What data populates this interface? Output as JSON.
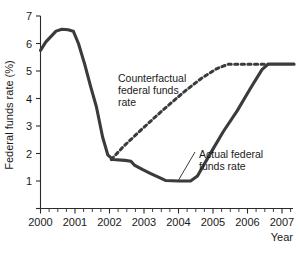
{
  "chart_data": {
    "type": "line",
    "title": "",
    "xlabel": "Year",
    "ylabel": "Federal funds rate (%)",
    "xlim": [
      2000,
      2007.35
    ],
    "ylim": [
      0,
      7
    ],
    "grid": false,
    "legend_position": "inline-annotations",
    "xticks": [
      "2000",
      "2001",
      "2002",
      "2003",
      "2004",
      "2005",
      "2006",
      "2007"
    ],
    "xtick_values": [
      2000,
      2001,
      2002,
      2003,
      2004,
      2005,
      2006,
      2007
    ],
    "xminor_per_interval": 3,
    "yticks": [
      "1",
      "2",
      "3",
      "4",
      "5",
      "6",
      "7"
    ],
    "ytick_values": [
      1,
      2,
      3,
      4,
      5,
      6,
      7
    ],
    "series": [
      {
        "name": "Actual federal funds rate",
        "style": "solid",
        "color": "#3b3b3b",
        "points": [
          [
            2000.0,
            5.75
          ],
          [
            2000.15,
            6.05
          ],
          [
            2000.3,
            6.25
          ],
          [
            2000.45,
            6.45
          ],
          [
            2000.62,
            6.52
          ],
          [
            2000.8,
            6.5
          ],
          [
            2000.95,
            6.45
          ],
          [
            2001.1,
            6.0
          ],
          [
            2001.28,
            5.25
          ],
          [
            2001.45,
            4.45
          ],
          [
            2001.62,
            3.7
          ],
          [
            2001.8,
            2.6
          ],
          [
            2001.95,
            1.95
          ],
          [
            2002.1,
            1.78
          ],
          [
            2002.45,
            1.75
          ],
          [
            2002.62,
            1.72
          ],
          [
            2002.72,
            1.58
          ],
          [
            2002.95,
            1.42
          ],
          [
            2003.18,
            1.28
          ],
          [
            2003.45,
            1.12
          ],
          [
            2003.62,
            1.02
          ],
          [
            2004.0,
            1.0
          ],
          [
            2004.35,
            1.0
          ],
          [
            2004.55,
            1.18
          ],
          [
            2004.9,
            1.95
          ],
          [
            2005.3,
            2.8
          ],
          [
            2005.7,
            3.55
          ],
          [
            2006.1,
            4.4
          ],
          [
            2006.42,
            5.05
          ],
          [
            2006.6,
            5.25
          ],
          [
            2007.35,
            5.25
          ]
        ]
      },
      {
        "name": "Counterfactual federal funds rate",
        "style": "dashed",
        "color": "#3b3b3b",
        "points": [
          [
            2002.05,
            1.78
          ],
          [
            2002.4,
            2.25
          ],
          [
            2002.85,
            2.78
          ],
          [
            2003.3,
            3.3
          ],
          [
            2003.75,
            3.8
          ],
          [
            2004.2,
            4.28
          ],
          [
            2004.65,
            4.72
          ],
          [
            2005.1,
            5.08
          ],
          [
            2005.45,
            5.25
          ],
          [
            2006.6,
            5.25
          ]
        ]
      }
    ],
    "annotations": [
      {
        "name": "counterfactual-label",
        "lines": [
          "Counterfactual",
          "federal funds",
          "rate"
        ],
        "x": 2002.25,
        "y": 4.55
      },
      {
        "name": "actual-label",
        "lines": [
          "Actual federal",
          "funds rate"
        ],
        "x": 2005.05,
        "y": 2.55
      }
    ]
  },
  "figure": {
    "ylabel": "Federal funds rate (%)",
    "xlabel": "Year",
    "annotation_counterfactual": {
      "line1": "Counterfactual",
      "line2": "federal funds",
      "line3": "rate"
    },
    "annotation_actual": {
      "line1": "Actual federal",
      "line2": "funds rate"
    },
    "yticks": {
      "t1": "1",
      "t2": "2",
      "t3": "3",
      "t4": "4",
      "t5": "5",
      "t6": "6",
      "t7": "7"
    },
    "xticks": {
      "t2000": "2000",
      "t2001": "2001",
      "t2002": "2002",
      "t2003": "2003",
      "t2004": "2004",
      "t2005": "2005",
      "t2006": "2006",
      "t2007": "2007"
    }
  }
}
